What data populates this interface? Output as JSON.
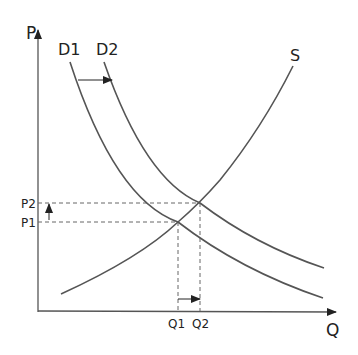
{
  "axes": {
    "y_label": "P",
    "x_label": "Q"
  },
  "curves": {
    "d1_label": "D1",
    "d2_label": "D2",
    "s_label": "S"
  },
  "prices": {
    "p1": "P1",
    "p2": "P2"
  },
  "quantities": {
    "q1": "Q1",
    "q2": "Q2"
  },
  "colors": {
    "line": "#555555",
    "text": "#222222"
  }
}
